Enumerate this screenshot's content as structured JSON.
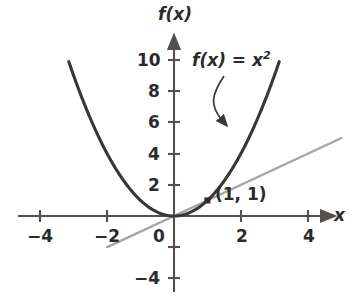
{
  "chart_data": {
    "type": "line",
    "title": "",
    "xlabel": "x",
    "ylabel": "f(x)",
    "xlim": [
      -4.6,
      4.8
    ],
    "ylim": [
      -5.2,
      11.0
    ],
    "grid": false,
    "legend": null,
    "x_ticks": [
      -4,
      -2,
      0,
      2,
      4
    ],
    "x_tick_labels": [
      "−4",
      "−2",
      "0",
      "2",
      "4"
    ],
    "y_ticks": [
      -4,
      -2,
      2,
      4,
      6,
      8,
      10
    ],
    "y_tick_labels": [
      "−4",
      "",
      "2",
      "4",
      "6",
      "8",
      "10"
    ],
    "series": [
      {
        "name": "f(x) = x^2",
        "type": "parabola",
        "equation": "y = x^2",
        "color": "#3a3634",
        "width": 3.1,
        "x_range": [
          -3.15,
          3.15
        ],
        "points": [
          {
            "x": -3.15,
            "y": 9.92
          },
          {
            "x": -3.0,
            "y": 9.0
          },
          {
            "x": -2.5,
            "y": 6.25
          },
          {
            "x": -2.0,
            "y": 4.0
          },
          {
            "x": -1.5,
            "y": 2.25
          },
          {
            "x": -1.0,
            "y": 1.0
          },
          {
            "x": -0.5,
            "y": 0.25
          },
          {
            "x": 0.0,
            "y": 0.0
          },
          {
            "x": 0.5,
            "y": 0.25
          },
          {
            "x": 1.0,
            "y": 1.0
          },
          {
            "x": 1.5,
            "y": 2.25
          },
          {
            "x": 2.0,
            "y": 4.0
          },
          {
            "x": 2.5,
            "y": 6.25
          },
          {
            "x": 3.0,
            "y": 9.0
          },
          {
            "x": 3.15,
            "y": 9.92
          }
        ]
      },
      {
        "name": "y = x",
        "type": "line",
        "equation": "y = x",
        "color": "#a6a6a6",
        "width": 2.4,
        "x_range": [
          -2.0,
          5.0
        ],
        "points": [
          {
            "x": -2.0,
            "y": -2.0
          },
          {
            "x": 5.0,
            "y": 5.0
          }
        ]
      }
    ],
    "markers": [
      {
        "name": "tangency-point",
        "x": 1,
        "y": 1,
        "label": "(1, 1)",
        "shape": "square",
        "color": "#2b2b2b",
        "size": 6
      }
    ],
    "annotations": [
      {
        "name": "function-label",
        "text_plain": "f(x) = x²",
        "text_fx": "f(x)",
        "text_eq": "=",
        "text_base": "x",
        "text_exp": "2",
        "arrow": "curved arrow pointing down-right from label to parabola right branch"
      }
    ],
    "axis_arrows": {
      "x_positive": true,
      "y_positive": true
    },
    "axis_color": "#55504e"
  },
  "labels": {
    "y_axis_name": "f(x)",
    "x_axis_name": "x",
    "point_annotation": "(1, 1)",
    "function_label_fx": "f(x)",
    "function_label_eq": "=",
    "function_label_base": "x",
    "function_label_exp": "2",
    "tick_x_neg4": "−4",
    "tick_x_neg2": "−2",
    "tick_x_0": "0",
    "tick_x_2": "2",
    "tick_x_4": "4",
    "tick_y_10": "10",
    "tick_y_8": "8",
    "tick_y_6": "6",
    "tick_y_4": "4",
    "tick_y_2": "2",
    "tick_y_neg4": "−4"
  },
  "colors": {
    "background": "#ffffff",
    "axis": "#55504e",
    "parabola": "#3a3634",
    "line": "#a6a6a6",
    "text": "#2b2b2b"
  }
}
